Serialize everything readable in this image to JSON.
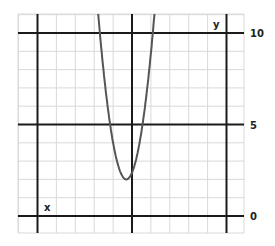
{
  "chart_data": {
    "type": "line",
    "title": "",
    "xlabel": "x",
    "ylabel": "y",
    "y_tick_labels": [
      "0",
      "5",
      "10"
    ],
    "y_ticks": [
      0,
      5,
      10
    ],
    "xlim": [
      -5,
      6
    ],
    "ylim": [
      -1,
      11
    ],
    "grid": true,
    "legend": null,
    "colors": {
      "curve": "#555555",
      "grid_minor": "#d9d9d9",
      "grid_major": "#1a1a1a",
      "background": "#ffffff"
    },
    "series": [
      {
        "name": "parabola",
        "x": [
          -1.6,
          -1.5,
          -1.2,
          -0.9,
          -0.6,
          -0.3,
          0.0,
          0.3,
          0.6,
          0.9,
          1.1,
          1.2
        ],
        "y": [
          11.0,
          10.0,
          7.1,
          4.8,
          3.0,
          2.0,
          2.4,
          3.8,
          5.9,
          8.6,
          10.0,
          11.0
        ]
      }
    ],
    "vertex": {
      "x": -0.3,
      "y": 2.0
    }
  }
}
